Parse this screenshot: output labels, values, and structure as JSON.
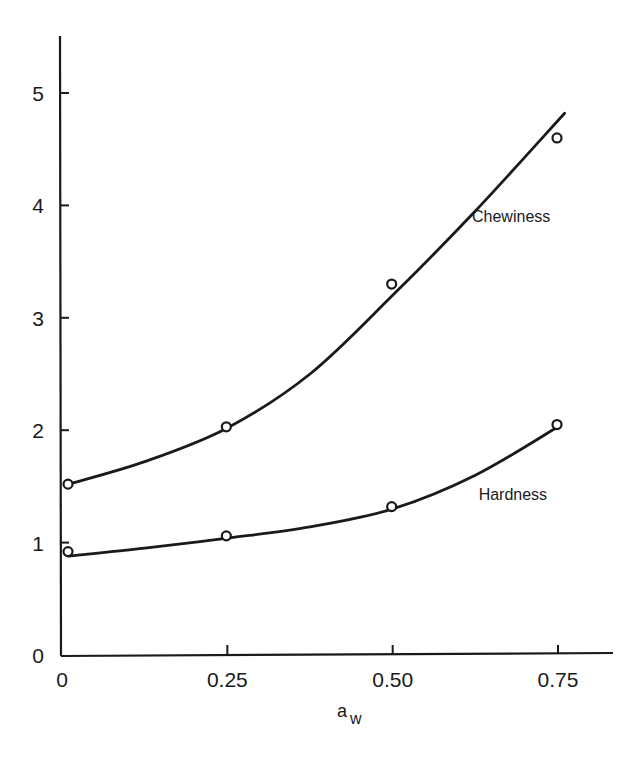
{
  "chart_data": {
    "type": "line",
    "title": "",
    "xlabel": "a_w",
    "xlabel_main": "a",
    "xlabel_sub": "w",
    "ylabel": "",
    "xlim": [
      0,
      0.83
    ],
    "ylim": [
      0,
      5.5
    ],
    "grid": false,
    "legend": "inline labels",
    "x_ticks": [
      0,
      0.25,
      0.5,
      0.75
    ],
    "x_tick_labels": [
      "0",
      "0.25",
      "0.50",
      "0.75"
    ],
    "y_ticks": [
      0,
      1,
      2,
      3,
      4,
      5
    ],
    "y_tick_labels": [
      "0",
      "1",
      "2",
      "3",
      "4",
      "5"
    ],
    "x": [
      0,
      0.25,
      0.5,
      0.75
    ],
    "series": [
      {
        "name": "Chewiness",
        "marker": "open-circle",
        "values": [
          1.52,
          2.03,
          3.3,
          4.6
        ],
        "fit_curve": [
          [
            0.01,
            1.52
          ],
          [
            0.125,
            1.72
          ],
          [
            0.25,
            2.02
          ],
          [
            0.375,
            2.5
          ],
          [
            0.5,
            3.2
          ],
          [
            0.625,
            3.95
          ],
          [
            0.76,
            4.82
          ]
        ]
      },
      {
        "name": "Hardness",
        "marker": "open-circle",
        "values": [
          0.92,
          1.06,
          1.32,
          2.05
        ],
        "fit_curve": [
          [
            0.01,
            0.88
          ],
          [
            0.125,
            0.95
          ],
          [
            0.25,
            1.04
          ],
          [
            0.375,
            1.14
          ],
          [
            0.5,
            1.3
          ],
          [
            0.625,
            1.6
          ],
          [
            0.75,
            2.03
          ]
        ]
      }
    ],
    "annotations": [
      {
        "text": "Chewiness",
        "x": 0.62,
        "y": 3.85
      },
      {
        "text": "Hardness",
        "x": 0.63,
        "y": 1.38
      }
    ]
  }
}
